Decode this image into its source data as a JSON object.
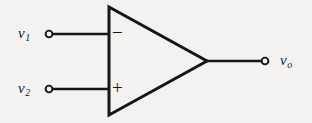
{
  "figure": {
    "name": "operational-amplifier-schematic",
    "background_color": "#f3f2f0",
    "ink_color": "#161616"
  },
  "amplifier": {
    "body_shape": "triangle",
    "inverting_sign": "−",
    "noninverting_sign": "+"
  },
  "terminals": {
    "input_inverting": {
      "label": "v",
      "subscript": "1",
      "marker": "open-circle"
    },
    "input_noninverting": {
      "label": "v",
      "subscript": "2",
      "marker": "open-circle"
    },
    "output": {
      "label": "v",
      "subscript": "o",
      "marker": "open-circle"
    }
  }
}
